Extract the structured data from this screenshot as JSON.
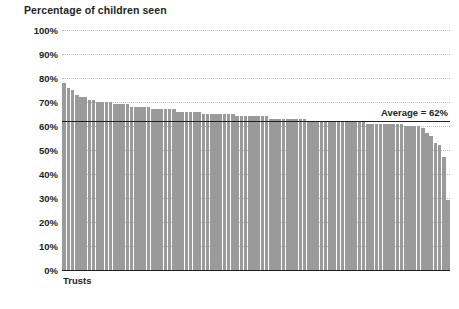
{
  "chart_data": {
    "type": "bar",
    "title": "Percentage of children seen",
    "xlabel": "Trusts",
    "ylabel": "",
    "ylim": [
      0,
      100
    ],
    "grid": true,
    "legend": "none",
    "ytick_labels": [
      "100%",
      "90%",
      "80%",
      "70%",
      "60%",
      "50%",
      "40%",
      "30%",
      "20%",
      "10%",
      "0%"
    ],
    "ytick_values": [
      100,
      90,
      80,
      70,
      60,
      50,
      40,
      30,
      20,
      10,
      0
    ],
    "annotations": [
      {
        "name": "average-line",
        "label": "Average = 62%",
        "value": 62
      }
    ],
    "categories": [
      "Trust 1",
      "Trust 2",
      "Trust 3",
      "Trust 4",
      "Trust 5",
      "Trust 6",
      "Trust 7",
      "Trust 8",
      "Trust 9",
      "Trust 10",
      "Trust 11",
      "Trust 12",
      "Trust 13",
      "Trust 14",
      "Trust 15",
      "Trust 16",
      "Trust 17",
      "Trust 18",
      "Trust 19",
      "Trust 20",
      "Trust 21",
      "Trust 22",
      "Trust 23",
      "Trust 24",
      "Trust 25",
      "Trust 26",
      "Trust 27",
      "Trust 28",
      "Trust 29",
      "Trust 30",
      "Trust 31",
      "Trust 32",
      "Trust 33",
      "Trust 34",
      "Trust 35",
      "Trust 36",
      "Trust 37",
      "Trust 38",
      "Trust 39",
      "Trust 40",
      "Trust 41",
      "Trust 42",
      "Trust 43",
      "Trust 44",
      "Trust 45",
      "Trust 46",
      "Trust 47",
      "Trust 48",
      "Trust 49",
      "Trust 50",
      "Trust 51",
      "Trust 52",
      "Trust 53",
      "Trust 54",
      "Trust 55",
      "Trust 56",
      "Trust 57",
      "Trust 58",
      "Trust 59",
      "Trust 60",
      "Trust 61",
      "Trust 62",
      "Trust 63",
      "Trust 64",
      "Trust 65",
      "Trust 66",
      "Trust 67",
      "Trust 68",
      "Trust 69",
      "Trust 70",
      "Trust 71",
      "Trust 72",
      "Trust 73",
      "Trust 74",
      "Trust 75",
      "Trust 76",
      "Trust 77",
      "Trust 78",
      "Trust 79",
      "Trust 80",
      "Trust 81",
      "Trust 82",
      "Trust 83",
      "Trust 84",
      "Trust 85",
      "Trust 86",
      "Trust 87",
      "Trust 88",
      "Trust 89",
      "Trust 90",
      "Trust 91",
      "Trust 92"
    ],
    "values": [
      78,
      76,
      75,
      73,
      72,
      72,
      71,
      71,
      70,
      70,
      70,
      70,
      69,
      69,
      69,
      69,
      68,
      68,
      68,
      68,
      68,
      67,
      67,
      67,
      67,
      67,
      67,
      66,
      66,
      66,
      66,
      66,
      66,
      65,
      65,
      65,
      65,
      65,
      65,
      65,
      65,
      64,
      64,
      64,
      64,
      64,
      64,
      64,
      64,
      63,
      63,
      63,
      63,
      63,
      63,
      63,
      63,
      63,
      62,
      62,
      62,
      62,
      62,
      62,
      62,
      62,
      62,
      62,
      62,
      62,
      62,
      62,
      61,
      61,
      61,
      61,
      61,
      61,
      61,
      61,
      61,
      60,
      60,
      60,
      60,
      59,
      57,
      56,
      53,
      52,
      47,
      29
    ],
    "colors": {
      "bar": "#9a9a9a",
      "axis": "#231f20",
      "gridline": "#bfbfbf",
      "average_line": "#231f20",
      "text": "#231f20",
      "background": "#ffffff"
    }
  }
}
